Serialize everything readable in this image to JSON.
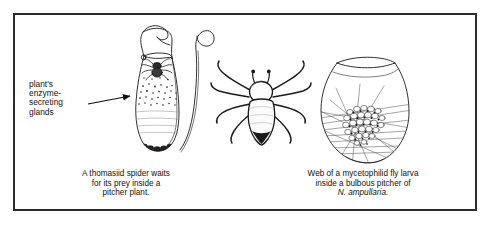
{
  "figure": {
    "name": "pitcher-plant-inquilines-figure",
    "background_color": "#ffffff",
    "frame_color": "#2b2b2b",
    "ink_color": "#1a1a1a",
    "annotation": {
      "label_text": "plant's\nenzyme-\nsecreting\nglands",
      "arrow": "arrow-pointing-right-to-pitcher"
    },
    "panels": [
      {
        "id": "panel-pitcher-spider",
        "illustration": "line-drawing-of-slender-nepenthes-pitcher-with-lid-tendril-spider-glands-and-fluid",
        "caption_lines": [
          "A thomasiid spider waits",
          "for its prey inside a",
          "pitcher plant."
        ]
      },
      {
        "id": "panel-spider-dorsal",
        "illustration": "line-drawing-of-thomasiid-crab-spider-dorsal-view",
        "caption_lines": []
      },
      {
        "id": "panel-bulbous-pitcher-web",
        "illustration": "line-drawing-of-bulbous-pitcher-with-fly-larva-web-and-debris-cluster",
        "caption_lines": [
          "Web of a mycetophilid fly larva",
          "inside a bulbous pitcher of"
        ],
        "caption_scientific_name": "N. ampullaria."
      }
    ]
  }
}
